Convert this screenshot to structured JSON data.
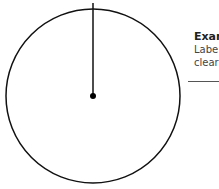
{
  "diagram": {
    "type": "clock-dial",
    "circle": {
      "cx": 93,
      "cy": 96,
      "r": 87,
      "stroke": "#111111"
    },
    "hand": {
      "x1": 93,
      "y1": 3,
      "x2": 93,
      "y2": 96,
      "stroke": "#111111"
    },
    "center_dot": {
      "cx": 93,
      "cy": 96,
      "r": 3,
      "fill": "#000000"
    }
  },
  "legend": {
    "title": "Exar",
    "lines": [
      "Labe",
      "clear"
    ]
  }
}
